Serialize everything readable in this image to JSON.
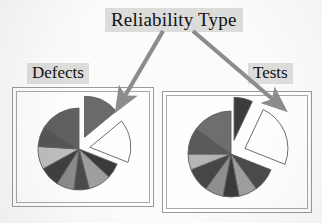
{
  "figure": {
    "title": "Reliability Type",
    "background_color": "#fbfbf9",
    "annotation_color": "#8c8c8a",
    "highlight_color": "#dcdcda"
  },
  "panels": [
    {
      "name": "defects",
      "label": "Defects",
      "callout_target": "exploded-dark-slice"
    },
    {
      "name": "tests",
      "label": "Tests",
      "callout_target": "exploded-dark-slice"
    }
  ],
  "arrows": [
    {
      "name": "arrow-to-defects",
      "from": "title-box",
      "to": "defects-chart-exploded-slice",
      "color": "#8c8c8a"
    },
    {
      "name": "arrow-to-tests",
      "from": "title-box",
      "to": "tests-chart-exploded-slice",
      "color": "#8c8c8a"
    }
  ],
  "chart_data": [
    {
      "type": "pie",
      "name": "defects",
      "title": "Defects",
      "legend": "none",
      "start_angle": -90,
      "labels": [
        "Reliability Type",
        "Category B",
        "Category C",
        "Category D",
        "Category E",
        "Category F",
        "Category G",
        "Category H",
        "Category I",
        "Category J"
      ],
      "values": [
        14,
        17,
        6,
        9,
        6,
        7,
        8,
        9,
        8,
        16
      ],
      "colors": [
        "#6b6b6b",
        "#fdfdfb",
        "#3a3a3a",
        "#9e9e9e",
        "#4a4a4a",
        "#8a8a8a",
        "#3f3f3f",
        "#bdbdbd",
        "#555555",
        "#606060"
      ],
      "exploded": [
        true,
        true,
        false,
        false,
        false,
        false,
        false,
        false,
        false,
        false
      ]
    },
    {
      "type": "pie",
      "name": "tests",
      "title": "Tests",
      "legend": "none",
      "start_angle": -90,
      "labels": [
        "Reliability Type",
        "Category B",
        "Category C",
        "Category D",
        "Category E",
        "Category F",
        "Category G",
        "Category H",
        "Category I",
        "Category J"
      ],
      "values": [
        7,
        24,
        9,
        7,
        6,
        7,
        9,
        6,
        10,
        15
      ],
      "colors": [
        "#3c3c3c",
        "#fdfdfb",
        "#4a4a4a",
        "#9e9e9e",
        "#3a3a3a",
        "#8e8e8e",
        "#464646",
        "#b5b5b5",
        "#5a5a5a",
        "#6e6e6e"
      ],
      "exploded": [
        true,
        true,
        false,
        false,
        false,
        false,
        false,
        false,
        false,
        false
      ]
    }
  ]
}
